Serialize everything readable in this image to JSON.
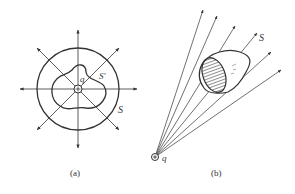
{
  "figure_a": {
    "caption": "(a)",
    "charge_label": "q",
    "outer_surface_label": "S",
    "inner_surface_label": "S'"
  },
  "figure_b": {
    "caption": "(b)",
    "charge_label": "q",
    "surface_label": "S"
  },
  "colors": {
    "stroke": "#333333",
    "background": "#ffffff"
  }
}
